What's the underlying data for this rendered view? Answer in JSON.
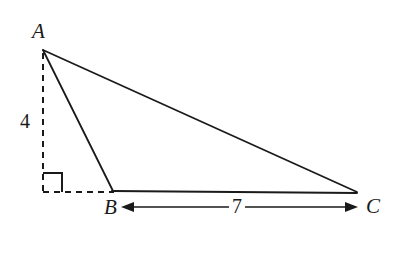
{
  "figure": {
    "background_color": "#ffffff",
    "stroke_color": "#1a1a1a",
    "vertices": [
      {
        "name": "A",
        "label": "A",
        "x": 43,
        "y": 49
      },
      {
        "name": "B",
        "label": "B",
        "x": 113,
        "y": 191
      },
      {
        "name": "C",
        "label": "C",
        "x": 357,
        "y": 192
      }
    ],
    "solid_edges": [
      {
        "name": "edge-AC",
        "from": "A",
        "to": "C"
      },
      {
        "name": "edge-AB",
        "from": "A",
        "to": "B"
      },
      {
        "name": "edge-BC",
        "from": "B",
        "to": "C"
      }
    ],
    "dashed_segments": [
      {
        "name": "altitude-from-A",
        "x1": 43,
        "y1": 53,
        "x2": 43,
        "y2": 192
      },
      {
        "name": "base-extension",
        "x1": 43,
        "y1": 192,
        "x2": 113,
        "y2": 192
      }
    ],
    "right_angle_marker": {
      "name": "right-angle-square",
      "corner_x": 43,
      "corner_y": 192,
      "size": 19
    },
    "dimension_arrow": {
      "name": "dimension-BC",
      "x1": 122,
      "x2": 357,
      "y": 207,
      "double_headed": true
    },
    "labels": {
      "vertex_a": "A",
      "vertex_b": "B",
      "vertex_c": "C",
      "altitude_length": "4",
      "base_length": "7"
    }
  }
}
